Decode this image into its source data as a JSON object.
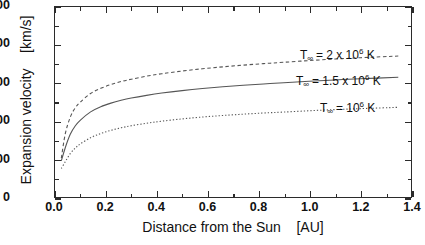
{
  "chart_data": {
    "type": "line",
    "title": "",
    "xlabel": "Distance from the Sun    [AU]",
    "ylabel": "Expansion velocity    [km/s]",
    "xlim": [
      0.0,
      1.4
    ],
    "ylim": [
      0,
      1000
    ],
    "grid": false,
    "legend_position": "inline-right-annotations",
    "xticks": [
      "0.0",
      "0.2",
      "0.4",
      "0.6",
      "0.8",
      "1.0",
      "1.2",
      "1.4"
    ],
    "xtick_values": [
      0.0,
      0.2,
      0.4,
      0.6,
      0.8,
      1.0,
      1.2,
      1.4
    ],
    "yticks": [
      "0",
      "200",
      "400",
      "600",
      "800",
      "1000"
    ],
    "ytick_values": [
      0,
      200,
      400,
      600,
      800,
      1000
    ],
    "x": [
      0.025,
      0.04,
      0.06,
      0.08,
      0.1,
      0.14,
      0.18,
      0.22,
      0.26,
      0.3,
      0.36,
      0.42,
      0.5,
      0.58,
      0.66,
      0.74,
      0.82,
      0.9,
      1.0,
      1.1,
      1.2,
      1.35
    ],
    "series": [
      {
        "name": "T_inf = 2 x 10^6 K",
        "label": "T∞ = 2 x 10⁶ K",
        "temperature_K": 2000000,
        "style": "dashed",
        "color": "#555555",
        "values": [
          205,
          330,
          420,
          470,
          500,
          545,
          572,
          592,
          608,
          620,
          636,
          649,
          663,
          675,
          685,
          694,
          702,
          709,
          718,
          726,
          733,
          742
        ]
      },
      {
        "name": "T_inf = 1.5 x 10^6 K",
        "label": "T∞ = 1.5 x 10⁶ K",
        "temperature_K": 1500000,
        "style": "solid",
        "color": "#555555",
        "values": [
          190,
          258,
          330,
          375,
          405,
          448,
          475,
          494,
          509,
          521,
          535,
          547,
          560,
          571,
          580,
          588,
          595,
          601,
          609,
          616,
          622,
          630
        ]
      },
      {
        "name": "T_inf = 10^6 K",
        "label": "T∞ = 10⁶ K",
        "temperature_K": 1000000,
        "style": "dotted",
        "color": "#555555",
        "values": [
          150,
          185,
          228,
          258,
          280,
          312,
          334,
          351,
          364,
          375,
          388,
          399,
          411,
          421,
          429,
          436,
          442,
          447,
          454,
          460,
          465,
          472
        ]
      }
    ],
    "annotations": [
      {
        "text_prefix": "T",
        "sub": "∞",
        "text_main": " =  2 x 10",
        "sup": "6",
        "text_suffix": " K"
      },
      {
        "text_prefix": "T",
        "sub": "∞",
        "text_main": " = 1.5 x 10",
        "sup": "6",
        "text_suffix": " K"
      },
      {
        "text_prefix": "T",
        "sub": "∞",
        "text_main": " =  10",
        "sup": "6",
        "text_suffix": " K"
      }
    ]
  },
  "axes": {
    "x_title": "Distance from the Sun    [AU]",
    "y_title": "Expansion velocity    [km/s]",
    "x_tick_labels": [
      "0.0",
      "0.2",
      "0.4",
      "0.6",
      "0.8",
      "1.0",
      "1.2",
      "1.4"
    ],
    "y_tick_labels": [
      "0",
      "200",
      "400",
      "600",
      "800",
      "1000"
    ]
  },
  "annotations": {
    "curve_top": {
      "t": "T",
      "sub": "∞",
      "mid": " =  2 x 10",
      "sup": "6",
      "end": " K"
    },
    "curve_middle": {
      "t": "T",
      "sub": "∞",
      "mid": " = 1.5 x 10",
      "sup": "6",
      "end": " K"
    },
    "curve_bottom": {
      "t": "T",
      "sub": "∞",
      "mid": " =  10",
      "sup": "6",
      "end": " K"
    }
  },
  "colors": {
    "axis": "#2b2b2b",
    "curve": "#555555",
    "background": "#ffffff",
    "text": "#111111"
  }
}
